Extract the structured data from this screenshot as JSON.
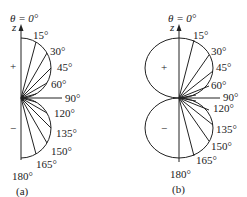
{
  "panels": [
    {
      "id": "a",
      "caption": "(a)",
      "top_label": "θ = 0°",
      "axis_label": "z",
      "upper_sign": "+",
      "lower_sign": "−",
      "angles": [
        "15°",
        "30°",
        "45°",
        "60°",
        "90°",
        "120°",
        "135°",
        "150°",
        "165°",
        "180°"
      ],
      "shape": "semicircles (right half only)"
    },
    {
      "id": "b",
      "caption": "(b)",
      "top_label": "θ = 0°",
      "axis_label": "z",
      "upper_sign": "+",
      "lower_sign": "−",
      "angles": [
        "15°",
        "30°",
        "45°",
        "60°",
        "90°",
        "120°",
        "135°",
        "150°",
        "165°",
        "180°"
      ],
      "shape": "full circles (two lobes)"
    }
  ]
}
